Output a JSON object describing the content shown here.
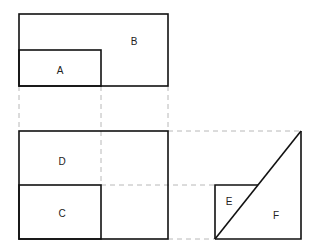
{
  "diagram": {
    "type": "orthographic-projection",
    "views": {
      "top": {
        "regions": [
          "A",
          "B"
        ]
      },
      "front": {
        "regions": [
          "C",
          "D"
        ]
      },
      "side": {
        "regions": [
          "E",
          "F"
        ]
      }
    },
    "labels": {
      "A": "A",
      "B": "B",
      "C": "C",
      "D": "D",
      "E": "E",
      "F": "F"
    },
    "colors": {
      "outline": "#111111",
      "projection_line": "#b8b8b8",
      "background": "#ffffff"
    }
  }
}
